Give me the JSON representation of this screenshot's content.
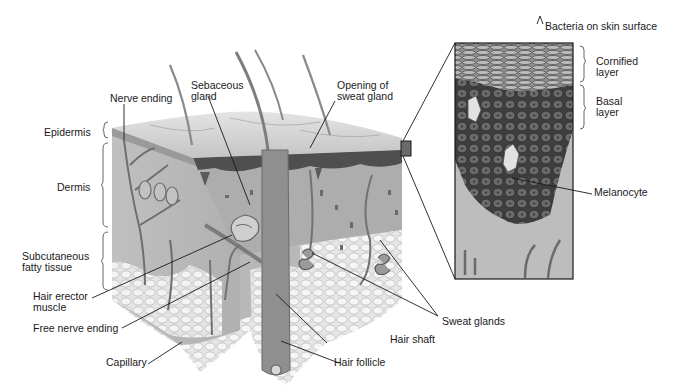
{
  "figure": {
    "colors": {
      "background": "#ffffff",
      "surface": "#c9c9c9",
      "epidermis_dark": "#5a5a5a",
      "dermis": "#a9a9a9",
      "fat": "#dcdcdc",
      "inset_cells": "#4a4a4a",
      "leader_line": "#1a1a1a"
    }
  },
  "labels": {
    "nerve_ending": "Nerve ending",
    "sebaceous_gland_1": "Sebaceous",
    "sebaceous_gland_2": "gland",
    "opening_sweat_1": "Opening of",
    "opening_sweat_2": "sweat gland",
    "epidermis": "Epidermis",
    "dermis": "Dermis",
    "subcutaneous_1": "Subcutaneous",
    "subcutaneous_2": "fatty tissue",
    "hair_erector_1": "Hair erector",
    "hair_erector_2": "muscle",
    "free_nerve_ending": "Free nerve ending",
    "capillary": "Capillary",
    "hair_follicle": "Hair follicle",
    "hair_shaft": "Hair shaft",
    "sweat_glands": "Sweat glands",
    "bacteria": "Bacteria on skin surface",
    "cornified_1": "Cornified",
    "cornified_2": "layer",
    "basal_1": "Basal",
    "basal_2": "layer",
    "melanocyte": "Melanocyte"
  }
}
